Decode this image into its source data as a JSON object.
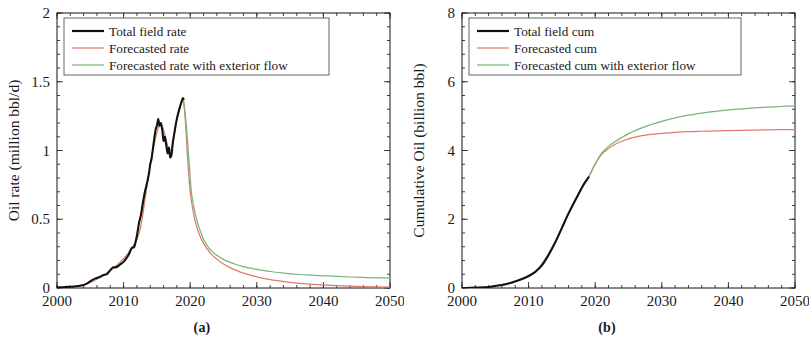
{
  "figure": {
    "panels": [
      {
        "id": "a",
        "caption": "(a)",
        "ylabel": "Oil rate (million bbl/d)",
        "xlabel": "",
        "legend": [
          {
            "label": "Total field rate",
            "color": "#111111",
            "width": 2.2
          },
          {
            "label": "Forecasted rate",
            "color": "#dd7b6b",
            "width": 1.2
          },
          {
            "label": "Forecasted rate with exterior flow",
            "color": "#79b37a",
            "width": 1.2
          }
        ]
      },
      {
        "id": "b",
        "caption": "(b)",
        "ylabel": "Cumulative Oil (billion bbl)",
        "xlabel": "",
        "legend": [
          {
            "label": "Total field cum",
            "color": "#111111",
            "width": 2.2
          },
          {
            "label": "Forecasted cum",
            "color": "#dd7b6b",
            "width": 1.2
          },
          {
            "label": "Forecasted cum with exterior flow",
            "color": "#79b37a",
            "width": 1.2
          }
        ]
      }
    ]
  },
  "chart_data": [
    {
      "type": "line",
      "panel": "a",
      "title": "",
      "xlabel": "",
      "ylabel": "Oil rate (million bbl/d)",
      "xlim": [
        2000,
        2050
      ],
      "ylim": [
        0,
        2
      ],
      "xticks": [
        2000,
        2010,
        2020,
        2030,
        2040,
        2050
      ],
      "yticks": [
        0,
        0.5,
        1,
        1.5,
        2
      ],
      "xtick_labels": [
        "2000",
        "2010",
        "2020",
        "2030",
        "2040",
        "2050"
      ],
      "ytick_labels": [
        "0",
        "0.5",
        "1",
        "1.5",
        "2"
      ],
      "minor_ticks": true,
      "grid": false,
      "legend_position": "upper-left",
      "series": [
        {
          "name": "Total field rate",
          "color": "#111111",
          "x": [
            2000.0,
            2000.8,
            2001.6,
            2002.4,
            2003.2,
            2004.0,
            2004.6,
            2005.2,
            2005.8,
            2006.4,
            2007.0,
            2007.5,
            2008.0,
            2008.4,
            2008.8,
            2009.2,
            2009.6,
            2010.0,
            2010.4,
            2010.8,
            2011.2,
            2011.6,
            2012.0,
            2012.3,
            2012.6,
            2012.9,
            2013.2,
            2013.5,
            2013.8,
            2014.0,
            2014.2,
            2014.5,
            2014.8,
            2015.0,
            2015.2,
            2015.4,
            2015.6,
            2015.8,
            2016.0,
            2016.2,
            2016.4,
            2016.6,
            2016.8,
            2017.0,
            2017.2,
            2017.4,
            2017.6,
            2017.8,
            2018.0,
            2018.3,
            2018.6,
            2018.9,
            2019.0
          ],
          "y": [
            0.005,
            0.006,
            0.008,
            0.01,
            0.014,
            0.022,
            0.035,
            0.055,
            0.07,
            0.08,
            0.095,
            0.1,
            0.13,
            0.15,
            0.15,
            0.16,
            0.175,
            0.19,
            0.215,
            0.245,
            0.29,
            0.3,
            0.38,
            0.47,
            0.53,
            0.62,
            0.7,
            0.76,
            0.83,
            0.9,
            0.94,
            1.05,
            1.15,
            1.18,
            1.23,
            1.18,
            1.2,
            1.15,
            1.07,
            1.1,
            1.04,
            0.98,
            1.02,
            0.95,
            0.97,
            1.06,
            1.12,
            1.18,
            1.23,
            1.29,
            1.34,
            1.38,
            1.375
          ]
        },
        {
          "name": "Forecasted rate",
          "color": "#dd7b6b",
          "x": [
            2003.0,
            2005.0,
            2007.0,
            2009.0,
            2011.0,
            2012.5,
            2014.0,
            2015.5,
            2017.0,
            2018.0,
            2018.6,
            2019.0,
            2019.3,
            2019.6,
            2020.0,
            2020.5,
            2021.0,
            2021.5,
            2022.0,
            2023.0,
            2024.0,
            2025.0,
            2026.0,
            2027.0,
            2028.0,
            2029.0,
            2030.0,
            2032.0,
            2034.0,
            2036.0,
            2038.0,
            2040.0,
            2042.0,
            2045.0,
            2048.0,
            2050.0
          ],
          "y": [
            0.012,
            0.04,
            0.095,
            0.165,
            0.275,
            0.43,
            0.9,
            1.19,
            1.0,
            1.23,
            1.33,
            1.36,
            1.2,
            0.95,
            0.7,
            0.54,
            0.44,
            0.375,
            0.325,
            0.255,
            0.21,
            0.175,
            0.148,
            0.126,
            0.108,
            0.093,
            0.081,
            0.061,
            0.047,
            0.036,
            0.028,
            0.022,
            0.017,
            0.012,
            0.009,
            0.007
          ]
        },
        {
          "name": "Forecasted rate with exterior flow",
          "color": "#79b37a",
          "x": [
            2019.0,
            2019.4,
            2019.8,
            2020.2,
            2020.8,
            2021.4,
            2022.0,
            2022.6,
            2023.2,
            2024.0,
            2025.0,
            2026.0,
            2027.0,
            2028.0,
            2029.0,
            2030.0,
            2032.0,
            2034.0,
            2036.0,
            2038.0,
            2040.0,
            2042.0,
            2044.0,
            2046.0,
            2048.0,
            2050.0
          ],
          "y": [
            1.36,
            1.19,
            0.94,
            0.69,
            0.53,
            0.43,
            0.355,
            0.305,
            0.27,
            0.238,
            0.208,
            0.186,
            0.169,
            0.155,
            0.144,
            0.135,
            0.12,
            0.109,
            0.1,
            0.094,
            0.089,
            0.084,
            0.08,
            0.077,
            0.074,
            0.072
          ]
        }
      ]
    },
    {
      "type": "line",
      "panel": "b",
      "title": "",
      "xlabel": "",
      "ylabel": "Cumulative Oil (billion bbl)",
      "xlim": [
        2000,
        2050
      ],
      "ylim": [
        0,
        8
      ],
      "xticks": [
        2000,
        2010,
        2020,
        2030,
        2040,
        2050
      ],
      "yticks": [
        0,
        2,
        4,
        6,
        8
      ],
      "xtick_labels": [
        "2000",
        "2010",
        "2020",
        "2030",
        "2040",
        "2050"
      ],
      "ytick_labels": [
        "0",
        "2",
        "4",
        "6",
        "8"
      ],
      "minor_ticks": true,
      "grid": false,
      "legend_position": "upper-left",
      "series": [
        {
          "name": "Total field cum",
          "color": "#111111",
          "x": [
            2000,
            2002,
            2004,
            2006,
            2007,
            2008,
            2009,
            2010,
            2011,
            2012,
            2013,
            2014,
            2015,
            2016,
            2017,
            2018,
            2018.5,
            2019.0
          ],
          "y": [
            0.0,
            0.01,
            0.03,
            0.09,
            0.13,
            0.19,
            0.26,
            0.35,
            0.47,
            0.66,
            0.96,
            1.33,
            1.75,
            2.17,
            2.55,
            2.92,
            3.08,
            3.22
          ]
        },
        {
          "name": "Forecasted cum",
          "color": "#dd7b6b",
          "x": [
            2004,
            2008,
            2011,
            2014,
            2016,
            2018,
            2019.0,
            2019.5,
            2020,
            2020.5,
            2021,
            2022,
            2023,
            2024,
            2025,
            2026,
            2027,
            2028,
            2030,
            2032,
            2034,
            2036,
            2038,
            2040,
            2043,
            2046,
            2050
          ],
          "y": [
            0.03,
            0.19,
            0.47,
            1.33,
            2.17,
            2.92,
            3.22,
            3.42,
            3.6,
            3.76,
            3.9,
            4.06,
            4.18,
            4.27,
            4.34,
            4.39,
            4.43,
            4.46,
            4.5,
            4.53,
            4.55,
            4.56,
            4.57,
            4.58,
            4.59,
            4.6,
            4.61
          ]
        },
        {
          "name": "Forecasted cum with exterior flow",
          "color": "#79b37a",
          "x": [
            2019.0,
            2019.5,
            2020,
            2020.5,
            2021,
            2022,
            2023,
            2024,
            2025,
            2026,
            2027,
            2028,
            2029,
            2030,
            2032,
            2034,
            2036,
            2038,
            2040,
            2042,
            2044,
            2046,
            2048,
            2050
          ],
          "y": [
            3.22,
            3.42,
            3.61,
            3.78,
            3.93,
            4.12,
            4.26,
            4.38,
            4.49,
            4.58,
            4.66,
            4.73,
            4.79,
            4.85,
            4.95,
            5.03,
            5.09,
            5.14,
            5.18,
            5.21,
            5.24,
            5.26,
            5.28,
            5.3
          ]
        }
      ]
    }
  ]
}
